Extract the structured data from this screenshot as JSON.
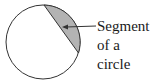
{
  "diagram": {
    "label_lines": [
      "Segment",
      "of a",
      "circle"
    ],
    "colors": {
      "circle_stroke": "#333333",
      "circle_fill": "#ffffff",
      "segment_fill": "#b3b3b3",
      "arrow": "#333333",
      "text": "#1a1a1a"
    }
  }
}
